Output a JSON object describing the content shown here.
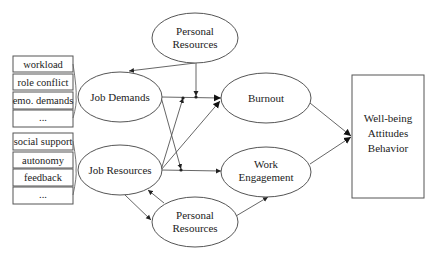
{
  "diagram": {
    "demands_items": [
      "workload",
      "role conflict",
      "emo. demands",
      "..."
    ],
    "resources_items": [
      "social support",
      "autonomy",
      "feedback",
      "..."
    ],
    "nodes": {
      "personal_resources_top": [
        "Personal",
        "Resources"
      ],
      "job_demands": "Job Demands",
      "job_resources": "Job Resources",
      "burnout": "Burnout",
      "work_engagement": [
        "Work",
        "Engagement"
      ],
      "personal_resources_bottom": [
        "Personal",
        "Resources"
      ],
      "outcomes": [
        "Well-being",
        "Attitudes",
        "Behavior"
      ]
    },
    "edges": [
      {
        "from": "personal_resources_top",
        "to": "job_demands"
      },
      {
        "from": "personal_resources_top",
        "to": "job_demands->burnout",
        "type": "moderation"
      },
      {
        "from": "job_demands",
        "to": "burnout"
      },
      {
        "from": "job_demands",
        "to": "job_resources->work_engagement",
        "type": "moderation"
      },
      {
        "from": "job_resources",
        "to": "job_demands->burnout",
        "type": "moderation"
      },
      {
        "from": "job_resources",
        "to": "burnout"
      },
      {
        "from": "job_resources",
        "to": "work_engagement"
      },
      {
        "from": "job_resources",
        "to": "personal_resources_bottom"
      },
      {
        "from": "personal_resources_bottom",
        "to": "job_resources"
      },
      {
        "from": "personal_resources_bottom",
        "to": "work_engagement"
      },
      {
        "from": "burnout",
        "to": "outcomes"
      },
      {
        "from": "work_engagement",
        "to": "outcomes"
      }
    ]
  }
}
